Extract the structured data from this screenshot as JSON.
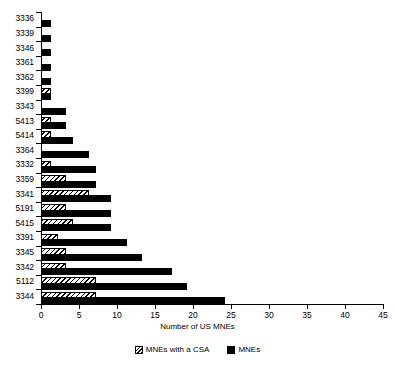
{
  "chart_data": {
    "type": "bar",
    "orientation": "horizontal",
    "title": "",
    "xlabel": "Number of US MNEs",
    "ylabel": "",
    "xlim": [
      0,
      45
    ],
    "xticks": [
      0,
      5,
      10,
      15,
      20,
      25,
      30,
      35,
      40,
      45
    ],
    "grid": false,
    "legend_position": "bottom",
    "categories": [
      "3336",
      "3339",
      "3346",
      "3361",
      "3362",
      "3399",
      "3343",
      "5413",
      "5414",
      "3364",
      "3332",
      "3359",
      "3341",
      "5191",
      "5415",
      "3391",
      "3345",
      "3342",
      "5112",
      "3344"
    ],
    "series": [
      {
        "name": "MNEs with a CSA",
        "style": "hatched",
        "values": [
          0,
          0,
          0,
          0,
          0,
          1,
          0,
          1,
          1,
          0,
          1,
          3,
          6,
          3,
          4,
          2,
          3,
          3,
          7,
          7
        ]
      },
      {
        "name": "MNEs",
        "style": "solid",
        "values": [
          1,
          1,
          1,
          1,
          1,
          1,
          3,
          3,
          4,
          6,
          7,
          7,
          9,
          9,
          9,
          11,
          13,
          17,
          19,
          24
        ]
      }
    ]
  },
  "axis": {
    "y_labels": [
      "3336",
      "3339",
      "3346",
      "3361",
      "3362",
      "3399",
      "3343",
      "5413",
      "5414",
      "3364",
      "3332",
      "3359",
      "3341",
      "5191",
      "5415",
      "3391",
      "3345",
      "3342",
      "5112",
      "3344"
    ],
    "x_labels": [
      "0",
      "5",
      "10",
      "15",
      "20",
      "25",
      "30",
      "35",
      "40",
      "45"
    ],
    "x_title": "Number of US MNEs"
  },
  "legend": {
    "items": [
      {
        "label": "MNEs with a CSA",
        "swatch": "hatched-swatch"
      },
      {
        "label": "MNEs",
        "swatch": "solid-black-swatch"
      }
    ]
  },
  "colors": {
    "bar_solid": "#000000",
    "bar_hatch_line": "#000000",
    "bar_hatch_bg": "#ffffff",
    "axis": "#000000",
    "background": "#ffffff"
  }
}
